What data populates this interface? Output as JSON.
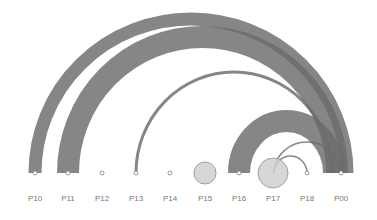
{
  "diagram": {
    "type": "arc-diagram",
    "baseline_y": 173,
    "label_y": 201,
    "colors": {
      "arc": "#6b6b6b",
      "arc_opacity": 0.82,
      "node_fill": "#d0d0d0",
      "node_stroke": "#8e8e8e",
      "label": "#777777",
      "background": "#ffffff"
    },
    "nodes": [
      {
        "id": "P10",
        "label": "P10",
        "x": 35,
        "r": 2
      },
      {
        "id": "P11",
        "label": "P11",
        "x": 68,
        "r": 2
      },
      {
        "id": "P12",
        "label": "P12",
        "x": 102,
        "r": 2
      },
      {
        "id": "P13",
        "label": "P13",
        "x": 136,
        "r": 2
      },
      {
        "id": "P14",
        "label": "P14",
        "x": 170,
        "r": 2
      },
      {
        "id": "P15",
        "label": "P15",
        "x": 205,
        "r": 11
      },
      {
        "id": "P16",
        "label": "P16",
        "x": 239,
        "r": 2
      },
      {
        "id": "P17",
        "label": "P17",
        "x": 273,
        "r": 15
      },
      {
        "id": "P18",
        "label": "P18",
        "x": 307,
        "r": 2
      },
      {
        "id": "P00",
        "label": "P00",
        "x": 341,
        "r": 2
      }
    ],
    "links": [
      {
        "source": "P10",
        "target": "P00",
        "x1": 35,
        "x2": 347,
        "ry": 154,
        "width": 13
      },
      {
        "source": "P11",
        "target": "P00",
        "x1": 68,
        "x2": 337,
        "ry": 136,
        "width": 22
      },
      {
        "source": "P13",
        "target": "P00",
        "x1": 136,
        "x2": 332,
        "ry": 101,
        "width": 3
      },
      {
        "source": "P16",
        "target": "P00",
        "x1": 239,
        "x2": 334,
        "ry": 52,
        "width": 22
      },
      {
        "source": "P17",
        "target": "P00",
        "x1": 274,
        "x2": 340,
        "ry": 31,
        "width": 1.5
      },
      {
        "source": "P17",
        "target": "P18",
        "x1": 274,
        "x2": 307,
        "ry": 17,
        "width": 1.5
      }
    ]
  }
}
